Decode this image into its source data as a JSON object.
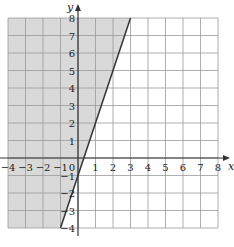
{
  "chart_data": {
    "type": "line",
    "title": "",
    "xlabel": "x",
    "ylabel": "y",
    "xlim": [
      -4,
      8
    ],
    "ylim": [
      -4,
      8
    ],
    "grid": true,
    "x_ticks": [
      "-4",
      "-3",
      "-2",
      "-1",
      "0",
      "1",
      "2",
      "3",
      "4",
      "5",
      "6",
      "7",
      "8"
    ],
    "y_ticks": [
      "-4",
      "-3",
      "-2",
      "-1",
      "1",
      "2",
      "3",
      "4",
      "5",
      "6",
      "7",
      "8"
    ],
    "series": [
      {
        "name": "boundary line y = 3x - 1",
        "style": "solid",
        "points": [
          [
            -1,
            -4
          ],
          [
            3,
            8
          ]
        ]
      }
    ],
    "shaded_region": {
      "description": "region above/left of line, y >= 3x - 1",
      "color": "#d9d9d9"
    },
    "colors": {
      "grid": "#9a9a9a",
      "axis": "#333333",
      "line": "#333333",
      "shade": "#d9d9d9"
    }
  },
  "labels": {
    "x_axis": "x",
    "y_axis": "y",
    "origin": "0"
  }
}
